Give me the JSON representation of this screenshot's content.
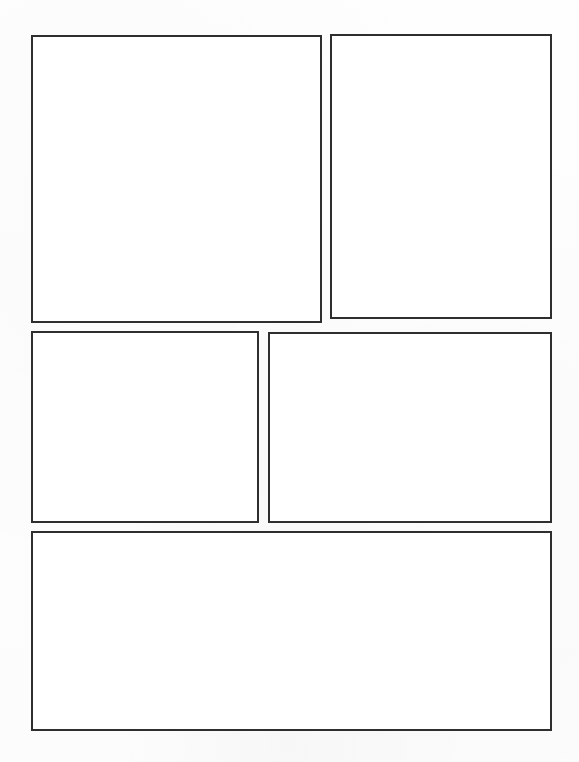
{
  "page": {
    "kind": "comic-page-layout",
    "width_px": 579,
    "height_px": 762,
    "background_color": "#fefefe",
    "paper_color": "#ffffff",
    "border_color": "#2e2e2e",
    "panel_fill_color": "#ffffff",
    "panel_count": 5,
    "row_count": 3,
    "orientation": "portrait",
    "content_text": ""
  },
  "panels": [
    {
      "id": "panel-1",
      "name": "top-left-panel",
      "row": 1,
      "column": 1,
      "x": 31,
      "y": 35,
      "width": 291,
      "height": 288,
      "border_width": 2,
      "border_color": "#2e2e2e",
      "fill": "#ffffff",
      "content": ""
    },
    {
      "id": "panel-2",
      "name": "top-right-panel",
      "row": 1,
      "column": 2,
      "x": 330,
      "y": 34,
      "width": 222,
      "height": 285,
      "border_width": 2,
      "border_color": "#2e2e2e",
      "fill": "#ffffff",
      "content": ""
    },
    {
      "id": "panel-3",
      "name": "middle-left-panel",
      "row": 2,
      "column": 1,
      "x": 31,
      "y": 331,
      "width": 228,
      "height": 192,
      "border_width": 2,
      "border_color": "#2e2e2e",
      "fill": "#ffffff",
      "content": ""
    },
    {
      "id": "panel-4",
      "name": "middle-right-panel",
      "row": 2,
      "column": 2,
      "x": 268,
      "y": 332,
      "width": 284,
      "height": 191,
      "border_width": 2,
      "border_color": "#2e2e2e",
      "fill": "#ffffff",
      "content": ""
    },
    {
      "id": "panel-5",
      "name": "bottom-wide-panel",
      "row": 3,
      "column": 1,
      "x": 31,
      "y": 531,
      "width": 521,
      "height": 200,
      "border_width": 2,
      "border_color": "#2e2e2e",
      "fill": "#ffffff",
      "content": ""
    }
  ]
}
